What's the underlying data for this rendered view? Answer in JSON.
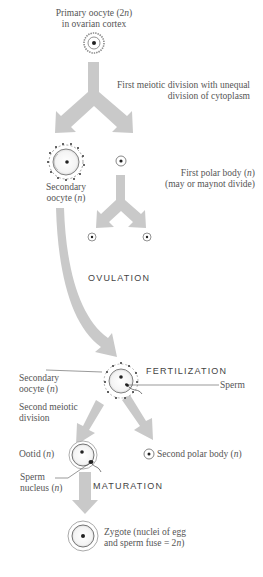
{
  "diagram": {
    "top_cut_text": "",
    "colors": {
      "arrow": "#c9c9c9",
      "cell_outline": "#6e6e6e",
      "nucleus": "#222222",
      "text": "#555555",
      "background": "#ffffff"
    },
    "nodes": {
      "primary_oocyte": {
        "line1": "Primary oocyte (2n)",
        "line2": "in ovarian cortex"
      },
      "first_meiotic_division": {
        "line1": "First meiotic division with unequal",
        "line2": "division of cytoplasm"
      },
      "secondary_oocyte_1": {
        "line1": "Secondary",
        "line2": "oocyte (n)"
      },
      "first_polar_body": {
        "line1": "First polar body (n)",
        "line2": "(may or maynot divide)"
      },
      "ovulation": {
        "label": "OVULATION"
      },
      "fertilization": {
        "label": "FERTILIZATION"
      },
      "secondary_oocyte_2": {
        "line1": "Secondary",
        "line2": "oocyte (n)"
      },
      "sperm": {
        "label": "Sperm"
      },
      "second_meiotic_division": {
        "line1": "Second meiotic",
        "line2": "division"
      },
      "ootid": {
        "label": "Ootid (n)"
      },
      "second_polar_body": {
        "label": "Second polar body (n)"
      },
      "sperm_nucleus": {
        "line1": "Sperm",
        "line2": "nucleus (n)"
      },
      "maturation": {
        "label": "MATURATION"
      },
      "zygote": {
        "line1": "Zygote (nuclei of egg",
        "line2": "and sperm fuse = 2n)"
      }
    },
    "edges": [
      {
        "from": "primary_oocyte",
        "to": "secondary_oocyte_1",
        "label": "First meiotic division with unequal division of cytoplasm"
      },
      {
        "from": "primary_oocyte",
        "to": "first_polar_body",
        "label": "First meiotic division with unequal division of cytoplasm"
      },
      {
        "from": "first_polar_body",
        "to": "polar_body_daughter_1",
        "label": ""
      },
      {
        "from": "first_polar_body",
        "to": "polar_body_daughter_2",
        "label": ""
      },
      {
        "from": "secondary_oocyte_1",
        "to": "secondary_oocyte_2",
        "label": "OVULATION"
      },
      {
        "from": "secondary_oocyte_2",
        "to": "ootid",
        "label": "Second meiotic division"
      },
      {
        "from": "secondary_oocyte_2",
        "to": "second_polar_body",
        "label": "Second meiotic division"
      },
      {
        "from": "ootid",
        "to": "zygote",
        "label": "MATURATION"
      }
    ]
  }
}
